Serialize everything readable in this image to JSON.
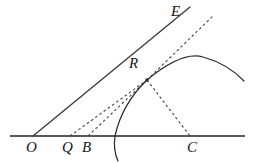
{
  "figure": {
    "background_color": "#ffffff",
    "ink_color": "#3a3a3a",
    "label_color": "#141414",
    "width": 257,
    "height": 163
  },
  "labels": [
    {
      "id": "E",
      "text": "E",
      "x": 171,
      "y": 4,
      "name": "point-label-e"
    },
    {
      "id": "R",
      "text": "R",
      "x": 129,
      "y": 56,
      "name": "point-label-r"
    },
    {
      "id": "O",
      "text": "O",
      "x": 26,
      "y": 140,
      "name": "point-label-o"
    },
    {
      "id": "Q",
      "text": "Q",
      "x": 62,
      "y": 140,
      "name": "point-label-q"
    },
    {
      "id": "B",
      "text": "B",
      "x": 82,
      "y": 140,
      "name": "point-label-b"
    },
    {
      "id": "C",
      "text": "C",
      "x": 187,
      "y": 140,
      "name": "point-label-c"
    }
  ],
  "geometry": {
    "baseline": {
      "x1": 10,
      "y1": 136,
      "x2": 245,
      "y2": 136,
      "width": 2.0,
      "name": "baseline-axis"
    },
    "solid_lines": [
      {
        "id": "OE",
        "x1": 33,
        "y1": 136,
        "x2": 190,
        "y2": 7,
        "width": 1.3,
        "name": "line-o-to-e"
      }
    ],
    "dashed_lines": [
      {
        "id": "QR",
        "x1": 70,
        "y1": 136,
        "x2": 147,
        "y2": 80,
        "name": "dashed-line-q-to-r"
      },
      {
        "id": "BR",
        "x1": 88,
        "y1": 136,
        "x2": 147,
        "y2": 80,
        "name": "dashed-line-b-to-r"
      },
      {
        "id": "RC",
        "x1": 147,
        "y1": 80,
        "x2": 190,
        "y2": 136,
        "name": "dashed-line-r-to-c"
      },
      {
        "id": "RX",
        "x1": 147,
        "y1": 80,
        "x2": 213,
        "y2": 16,
        "name": "dashed-line-r-upper"
      }
    ],
    "arcs": [
      {
        "id": "hump",
        "d": "M 147 80 Q 182 51 203 57 Q 228 64 244 81",
        "name": "arc-upper-curve"
      },
      {
        "id": "circle",
        "d": "M 147 80 Q 122 104 115 136 Q 113 150 118 161",
        "name": "arc-circle-through-r"
      }
    ],
    "points": [
      {
        "id": "R",
        "x": 147,
        "y": 80,
        "r": 1.8,
        "name": "vertex-point-r"
      }
    ],
    "dash_pattern": "2.6 2.6"
  }
}
